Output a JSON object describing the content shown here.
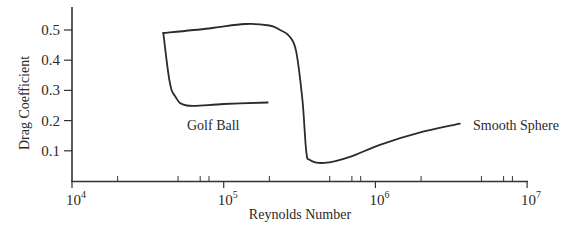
{
  "chart_data": {
    "type": "line",
    "title": "",
    "xlabel": "Reynolds Number",
    "ylabel": "Drag Coefficient",
    "xscale": "log",
    "xlim": [
      10000,
      10000000
    ],
    "ylim": [
      0,
      0.57
    ],
    "x_ticks": [
      {
        "base": "10",
        "exp": "4",
        "value": 10000
      },
      {
        "base": "10",
        "exp": "5",
        "value": 100000
      },
      {
        "base": "10",
        "exp": "6",
        "value": 1000000
      },
      {
        "base": "10",
        "exp": "7",
        "value": 10000000
      }
    ],
    "y_ticks": [
      "0.1",
      "0.2",
      "0.3",
      "0.4",
      "0.5"
    ],
    "grid": false,
    "legend": null,
    "series": [
      {
        "name": "Golf Ball",
        "x": [
          40000,
          44000,
          48000,
          57000,
          100000,
          195000
        ],
        "y": [
          0.49,
          0.33,
          0.28,
          0.25,
          0.255,
          0.26
        ]
      },
      {
        "name": "Smooth Sphere",
        "x": [
          40000,
          80000,
          138000,
          200000,
          235000,
          270000,
          300000,
          330000,
          350000,
          370000,
          460000,
          680000,
          1070000,
          1950000,
          3600000
        ],
        "y": [
          0.49,
          0.505,
          0.52,
          0.515,
          0.5,
          0.48,
          0.43,
          0.27,
          0.1,
          0.07,
          0.06,
          0.08,
          0.12,
          0.16,
          0.19
        ]
      }
    ],
    "annotations": [
      {
        "text": "Golf Ball",
        "near_series": "Golf Ball"
      },
      {
        "text": "Smooth Sphere",
        "near_series": "Smooth Sphere"
      }
    ]
  }
}
